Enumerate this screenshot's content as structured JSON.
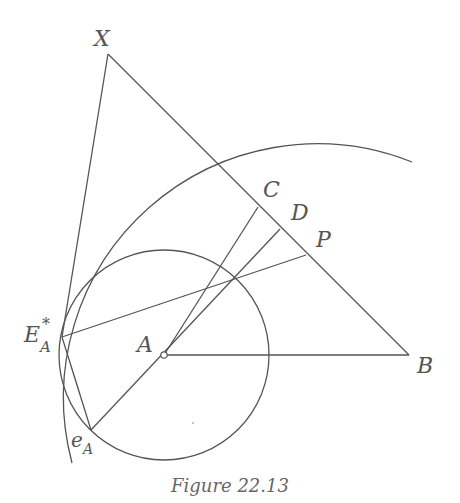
{
  "figure": {
    "caption": "Figure 22.13",
    "points": {
      "X": {
        "label": "X",
        "x": 108,
        "y": 54
      },
      "A": {
        "label": "A",
        "x": 164,
        "y": 355
      },
      "B": {
        "label": "B",
        "x": 409,
        "y": 355
      },
      "C": {
        "label": "C",
        "x": 258,
        "y": 207
      },
      "D": {
        "label": "D",
        "x": 280,
        "y": 229
      },
      "P": {
        "label": "P",
        "x": 306,
        "y": 255
      },
      "E_A_star": {
        "label": "E",
        "sup": "*",
        "sub": "A",
        "x": 62,
        "y": 337
      },
      "e_A": {
        "label": "e",
        "sub": "A",
        "x": 91,
        "y": 430
      }
    },
    "small_circle": {
      "center": "A",
      "radius": 105
    },
    "large_arc": {
      "cx": 312,
      "cy": 381,
      "radius": 254,
      "tangent_at": "E_A_star"
    },
    "segments": [
      [
        "X",
        "B"
      ],
      [
        "X",
        "E_A_star"
      ],
      [
        "A",
        "B"
      ],
      [
        "A",
        "C"
      ],
      [
        "e_A",
        "D"
      ],
      [
        "E_A_star",
        "P"
      ],
      [
        "E_A_star",
        "e_A"
      ]
    ],
    "stroke_color": "#555555"
  }
}
